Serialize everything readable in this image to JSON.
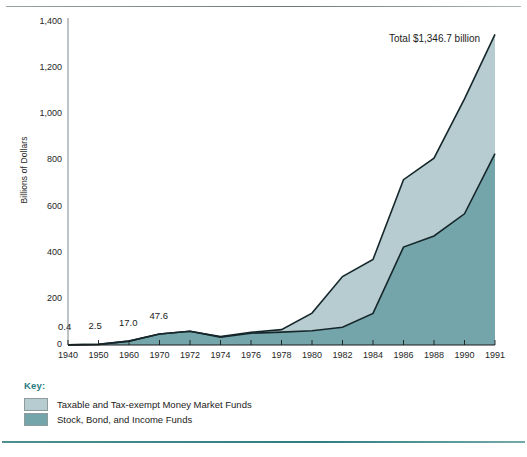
{
  "figure": {
    "annotation": "Total $1,346.7 billion",
    "key_title": "Key:"
  },
  "chart_data": {
    "type": "area",
    "stacked": true,
    "title": "",
    "xlabel": "",
    "ylabel": "Billions of Dollars",
    "ylim": [
      0,
      1400
    ],
    "yticks": [
      0,
      200,
      400,
      600,
      800,
      1000,
      1200,
      1400
    ],
    "ytick_labels": [
      "0",
      "200",
      "400",
      "600",
      "800",
      "1,000",
      "1,200",
      "1,400"
    ],
    "grid": false,
    "legend_position": "below-left",
    "categories": [
      1940,
      1950,
      1960,
      1970,
      1972,
      1974,
      1976,
      1978,
      1980,
      1982,
      1984,
      1986,
      1988,
      1990,
      1991
    ],
    "xtick_labels": [
      "1940",
      "1950",
      "1960",
      "1970",
      "1972",
      "1974",
      "1976",
      "1978",
      "1980",
      "1982",
      "1984",
      "1986",
      "1988",
      "1990",
      "1991"
    ],
    "series": [
      {
        "name": "Stock, Bond, and Income Funds",
        "color": "#74a5aa",
        "values": [
          0.4,
          2.5,
          17.0,
          47.6,
          59.8,
          34.1,
          51.3,
          55.8,
          61.8,
          76.8,
          137.1,
          424.2,
          472.3,
          568.5,
          829.0
        ]
      },
      {
        "name": "Taxable and Tax-exempt Money Market Funds",
        "color": "#b6ccd0",
        "values": [
          0.0,
          0.0,
          0.0,
          0.0,
          0.0,
          2.4,
          3.7,
          10.9,
          76.4,
          219.8,
          233.6,
          292.2,
          338.0,
          498.3,
          517.7
        ]
      }
    ],
    "totals": [
      0.4,
      2.5,
      17.0,
      47.6,
      59.8,
      36.5,
      55.0,
      66.7,
      138.2,
      296.6,
      370.7,
      716.4,
      810.3,
      1066.8,
      1346.7
    ],
    "point_labels": [
      {
        "x": 1940,
        "text": "0.4"
      },
      {
        "x": 1950,
        "text": "2.5"
      },
      {
        "x": 1960,
        "text": "17.0"
      },
      {
        "x": 1970,
        "text": "47.6"
      }
    ],
    "annotations": [
      {
        "text": "Total $1,346.7 billion",
        "x": 1991,
        "y": 1346.7
      }
    ]
  },
  "legend": {
    "items": [
      {
        "label": "Taxable and Tax-exempt Money Market Funds",
        "color": "#b6ccd0"
      },
      {
        "label": "Stock, Bond, and Income Funds",
        "color": "#74a5aa"
      }
    ]
  }
}
